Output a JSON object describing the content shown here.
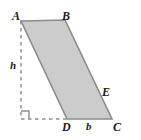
{
  "figure": {
    "name": "parallelogram-with-height",
    "type": "geometry-diagram",
    "background_color": "#ffffff",
    "fill_color": "#cccccc",
    "stroke_color": "#8c8c8c",
    "dash_color": "#8c8c8c",
    "label_color": "#1a1a1a",
    "vertices": {
      "A": {
        "label": "A",
        "x": 21,
        "y": 21
      },
      "B": {
        "label": "B",
        "x": 65,
        "y": 20
      },
      "C": {
        "label": "C",
        "x": 112,
        "y": 119
      },
      "D": {
        "label": "D",
        "x": 67,
        "y": 119
      },
      "E": {
        "label": "E",
        "x": 97,
        "y": 96
      }
    },
    "measure_labels": {
      "height": "h",
      "base": "b"
    },
    "label_positions": {
      "A": {
        "x": 12,
        "y": 10
      },
      "B": {
        "x": 62,
        "y": 10
      },
      "C": {
        "x": 113,
        "y": 121
      },
      "D": {
        "x": 63,
        "y": 121
      },
      "E": {
        "x": 102,
        "y": 86
      },
      "h": {
        "x": 10,
        "y": 60
      },
      "b": {
        "x": 86,
        "y": 121
      }
    },
    "polygon_points": "21,21 65,20 112,119 67,119",
    "dashed_vertical": {
      "x1": 21,
      "y1": 21,
      "x2": 21,
      "y2": 119
    },
    "dashed_horizontal": {
      "x1": 21,
      "y1": 119,
      "x2": 67,
      "y2": 119
    },
    "right_angle_marker": "29,119 29,111 21,111"
  }
}
